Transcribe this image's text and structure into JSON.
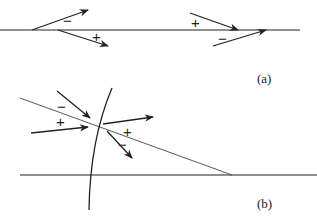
{
  "panels": {
    "a": {
      "label": "(a)",
      "left_group": {
        "upper_arrow_sign": "−",
        "lower_arrow_sign": "+"
      },
      "right_group": {
        "upper_arrow_sign": "+",
        "lower_arrow_sign": "−"
      }
    },
    "b": {
      "label": "(b)",
      "incoming_upper_sign": "−",
      "incoming_lower_sign": "+",
      "outgoing_upper_sign": "+",
      "outgoing_lower_sign": "−"
    }
  },
  "colors": {
    "stroke": "#222222",
    "background": "#ffffff"
  }
}
